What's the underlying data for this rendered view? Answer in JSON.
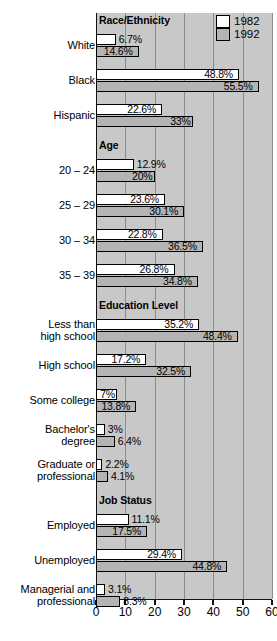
{
  "chart_data": {
    "type": "bar",
    "orientation": "horizontal",
    "title": "",
    "xlabel": "",
    "ylabel": "",
    "xlim": [
      0,
      60
    ],
    "xticks": [
      0,
      10,
      20,
      30,
      40,
      50,
      60
    ],
    "xticklabels": [
      "0",
      "10",
      "20",
      "30",
      "40",
      "50",
      "60"
    ],
    "grid": true,
    "grid_axis": "x",
    "legend": {
      "position": "top-right",
      "entries": [
        {
          "name": "1982",
          "color": "#ffffff"
        },
        {
          "name": "1992",
          "color": "#b4b4b4"
        }
      ]
    },
    "series": [
      {
        "name": "1982",
        "color": "#ffffff"
      },
      {
        "name": "1992",
        "color": "#b4b4b4"
      }
    ],
    "sections": [
      {
        "title": "Race/Ethnicity",
        "categories": [
          "White",
          "Black",
          "Hispanic"
        ],
        "values_1982": [
          6.7,
          48.8,
          22.6
        ],
        "values_1992": [
          14.6,
          55.5,
          33
        ],
        "labels_1982": [
          "6.7%",
          "48.8%",
          "22.6%"
        ],
        "labels_1992": [
          "14.6%",
          "55.5%",
          "33%"
        ]
      },
      {
        "title": "Age",
        "categories": [
          "20 – 24",
          "25 – 29",
          "30 – 34",
          "35 – 39"
        ],
        "values_1982": [
          12.9,
          23.6,
          22.8,
          26.8
        ],
        "values_1992": [
          20,
          30.1,
          36.5,
          34.8
        ],
        "labels_1982": [
          "12.9%",
          "23.6%",
          "22.8%",
          "26.8%"
        ],
        "labels_1992": [
          "20%",
          "30.1%",
          "36.5%",
          "34.8%"
        ]
      },
      {
        "title": "Education Level",
        "categories": [
          "Less than\nhigh school",
          "High school",
          "Some college",
          "Bachelor's\ndegree",
          "Graduate or\nprofessional"
        ],
        "values_1982": [
          35.2,
          17.2,
          7,
          3,
          2.2
        ],
        "values_1992": [
          48.4,
          32.5,
          13.8,
          6.4,
          4.1
        ],
        "labels_1982": [
          "35.2%",
          "17.2%",
          "7%",
          "3%",
          "2.2%"
        ],
        "labels_1992": [
          "48.4%",
          "32.5%",
          "13.8%",
          "6.4%",
          "4.1%"
        ]
      },
      {
        "title": "Job Status",
        "categories": [
          "Employed",
          "Unemployed",
          "Managerial and\nprofessional"
        ],
        "values_1982": [
          11.1,
          29.4,
          3.1
        ],
        "values_1992": [
          17.5,
          44.8,
          8.3
        ],
        "labels_1982": [
          "11.1%",
          "29.4%",
          "3.1%"
        ],
        "labels_1992": [
          "17.5%",
          "44.8%",
          "8.3%"
        ]
      }
    ]
  }
}
